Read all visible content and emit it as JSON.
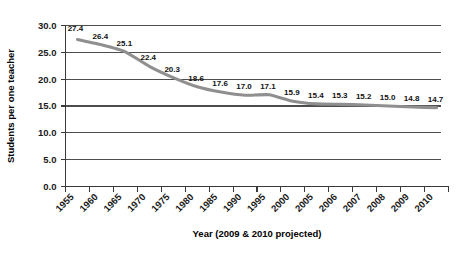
{
  "chart_data": {
    "type": "line",
    "title": "",
    "xlabel": "Year (2009 & 2010 projected)",
    "ylabel": "Students per one teacher",
    "categories": [
      "1955",
      "1960",
      "1965",
      "1970",
      "1975",
      "1980",
      "1985",
      "1990",
      "1995",
      "2000",
      "2005",
      "2006",
      "2007",
      "2008",
      "2009",
      "2010"
    ],
    "values": [
      27.4,
      26.4,
      25.1,
      22.4,
      20.3,
      18.6,
      17.6,
      17.0,
      17.1,
      15.9,
      15.4,
      15.3,
      15.2,
      15.0,
      14.8,
      14.7
    ],
    "point_labels": [
      "27.4",
      "26.4",
      "25.1",
      "22.4",
      "20.3",
      "18.6",
      "17.6",
      "17.0",
      "17.1",
      "15.9",
      "15.4",
      "15.3",
      "15.2",
      "15.0",
      "14.8",
      "14.7"
    ],
    "ylim": [
      0.0,
      30.0
    ],
    "yticks": [
      0.0,
      5.0,
      10.0,
      15.0,
      20.0,
      25.0,
      30.0
    ],
    "ytick_labels": [
      "0.0",
      "5.0",
      "10.0",
      "15.0",
      "20.0",
      "25.0",
      "30.0"
    ],
    "grid": true,
    "legend": "none",
    "series_color": "#8f8f8f",
    "axis_color": "#3a3a3a",
    "grid_color": "#4d4d4d"
  }
}
